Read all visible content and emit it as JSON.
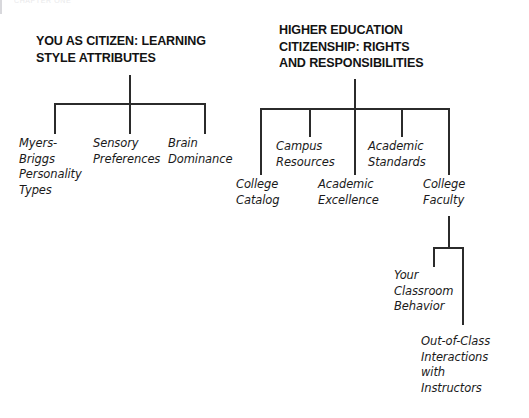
{
  "page": {
    "running_header": "CHAPTER ONE",
    "background_color": "#ffffff",
    "line_color": "#2b2b2b",
    "text_color": "#1a1a1a"
  },
  "diagram": {
    "type": "tree-concept-map",
    "trees": [
      {
        "id": "learning-style",
        "heading": "YOU AS CITIZEN: LEARNING\nSTYLE ATTRIBUTES",
        "children": [
          {
            "id": "myers-briggs",
            "label": "Myers-\nBriggs\nPersonality\nTypes"
          },
          {
            "id": "sensory-preferences",
            "label": "Sensory\nPreferences"
          },
          {
            "id": "brain-dominance",
            "label": "Brain\nDominance"
          }
        ]
      },
      {
        "id": "higher-education-citizenship",
        "heading": "HIGHER EDUCATION\nCITIZENSHIP: RIGHTS\nAND RESPONSIBILITIES",
        "children": [
          {
            "id": "college-catalog",
            "label": "College\nCatalog"
          },
          {
            "id": "campus-resources",
            "label": "Campus\nResources"
          },
          {
            "id": "academic-excellence",
            "label": "Academic\nExcellence"
          },
          {
            "id": "academic-standards",
            "label": "Academic\nStandards"
          },
          {
            "id": "college-faculty",
            "label": "College\nFaculty",
            "children": [
              {
                "id": "classroom-behavior",
                "label": "Your\nClassroom\nBehavior"
              },
              {
                "id": "out-of-class-interactions",
                "label": "Out-of-Class\nInteractions\nwith\nInstructors"
              }
            ]
          }
        ]
      }
    ]
  }
}
